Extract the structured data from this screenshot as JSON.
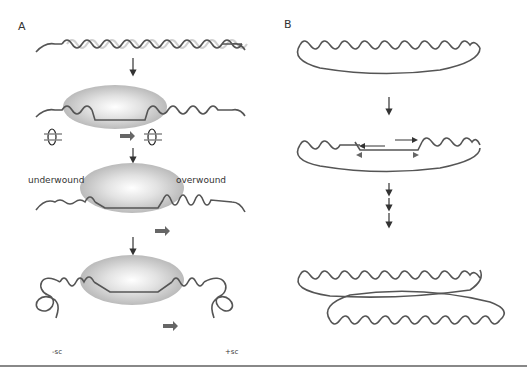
{
  "figure": {
    "panels": [
      {
        "id": "A",
        "label": "A",
        "annotations": {
          "underwound": "underwound",
          "overwound": "overwound",
          "negative_supercoil": "-sc",
          "positive_supercoil": "+sc"
        },
        "steps": [
          "relaxed linear DNA duplex",
          "polymerase bound with open bubble, rotation arrows",
          "polymerase translocating: underwound behind, overwound ahead",
          "supercoils formed: -sc behind, +sc ahead"
        ]
      },
      {
        "id": "B",
        "label": "B",
        "steps": [
          "relaxed circular DNA",
          "divergent replication/transcription bubble",
          "interlinked catenated circles"
        ]
      }
    ],
    "colors": {
      "strand": "#555555",
      "strand_light": "#cfcfcf",
      "enzyme": "#bcbcbc",
      "arrow": "#666666",
      "rule": "#888888"
    }
  }
}
